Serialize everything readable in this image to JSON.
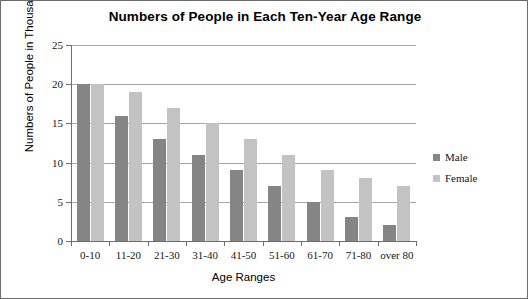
{
  "chart_data": {
    "type": "bar",
    "title": "Numbers of People in Each Ten-Year Age Range",
    "xlabel": "Age Ranges",
    "ylabel": "Numbers of People in Thousands",
    "categories": [
      "0-10",
      "11-20",
      "21-30",
      "31-40",
      "41-50",
      "51-60",
      "61-70",
      "71-80",
      "over 80"
    ],
    "series": [
      {
        "name": "Male",
        "color": "#858585",
        "values": [
          20,
          16,
          13,
          11,
          9,
          7,
          5,
          3,
          2
        ]
      },
      {
        "name": "Female",
        "color": "#c3c3c3",
        "values": [
          20,
          19,
          17,
          15,
          13,
          11,
          9,
          8,
          7
        ]
      }
    ],
    "ylim": [
      0,
      25
    ],
    "yticks": [
      0,
      5,
      10,
      15,
      20,
      25
    ],
    "ytick_labels": [
      "0",
      "5",
      "10",
      "15",
      "20",
      "25"
    ],
    "grid": true,
    "grid_axis": "y",
    "legend_position": "right",
    "bar_orientation": "vertical",
    "grouping": "clustered"
  }
}
